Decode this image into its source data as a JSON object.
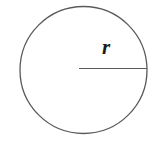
{
  "figure": {
    "kind": "geometry-diagram",
    "canvas": {
      "width": 159,
      "height": 147,
      "background_color": "#ffffff"
    },
    "labels": {
      "radius": "r"
    },
    "colors": {
      "stroke": "#5a5a5a",
      "label": "#1c1c1c",
      "background": "#ffffff"
    },
    "shapes": {
      "circle": {
        "name": "circle-outline",
        "center_x": 83.5,
        "center_y": 70,
        "radius": 63.5,
        "stroke_width": 1.3,
        "fill": "none"
      },
      "radius_segment": {
        "name": "radius-line",
        "x1": 79,
        "y1": 68.5,
        "x2": 147,
        "y2": 68.5,
        "stroke_width": 1.2
      },
      "radius_label": {
        "name": "radius-label",
        "x": 104,
        "y": 58,
        "font_size": 21
      }
    }
  }
}
